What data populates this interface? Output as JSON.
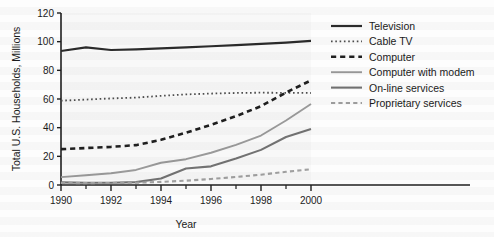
{
  "chart_data": {
    "type": "line",
    "title": "",
    "xlabel": "Year",
    "ylabel": "Total U.S. Households, Millions",
    "xlim": [
      1990,
      2000
    ],
    "ylim": [
      0,
      120
    ],
    "xticks": [
      1990,
      1992,
      1994,
      1996,
      1998,
      2000
    ],
    "xtick_labels": [
      "1990",
      "1992",
      "1994",
      "1996",
      "1998",
      "2000"
    ],
    "xminor_ticks": [
      1991,
      1993,
      1995,
      1997,
      1999
    ],
    "yticks": [
      0,
      20,
      40,
      60,
      80,
      100,
      120
    ],
    "ytick_labels": [
      "0",
      "20",
      "40",
      "60",
      "80",
      "100",
      "120"
    ],
    "grid": false,
    "legend_position": "upper right",
    "x": [
      1990,
      1991,
      1992,
      1993,
      1994,
      1995,
      1996,
      1997,
      1998,
      1999,
      2000
    ],
    "series": [
      {
        "name": "Television",
        "style": "solid",
        "color": "#2b2b2b",
        "width": 2.2,
        "values": [
          93.5,
          96.0,
          94.2,
          94.6,
          95.3,
          96.0,
          96.8,
          97.6,
          98.4,
          99.3,
          100.5
        ]
      },
      {
        "name": "Cable TV",
        "style": "dotted",
        "color": "#4d4d4d",
        "width": 1.8,
        "values": [
          58.8,
          59.6,
          60.4,
          61.0,
          62.2,
          63.2,
          63.8,
          64.2,
          64.4,
          64.3,
          64.2
        ]
      },
      {
        "name": "Computer",
        "style": "dashed",
        "color": "#1f1f1f",
        "width": 2.6,
        "values": [
          25.0,
          25.8,
          26.6,
          27.8,
          31.5,
          36.5,
          42.0,
          48.0,
          55.0,
          64.5,
          73.0
        ]
      },
      {
        "name": "Computer with modem",
        "style": "solid",
        "color": "#9a9a9a",
        "width": 1.9,
        "values": [
          5.5,
          6.8,
          8.2,
          10.5,
          15.5,
          18.0,
          22.5,
          28.0,
          34.5,
          45.0,
          56.5
        ]
      },
      {
        "name": "On-line services",
        "style": "solid",
        "color": "#737373",
        "width": 2.1,
        "values": [
          1.8,
          1.6,
          1.6,
          2.0,
          4.5,
          11.5,
          13.0,
          18.5,
          24.5,
          33.5,
          39.0
        ]
      },
      {
        "name": "Proprietary services",
        "style": "dashed",
        "color": "#a0a0a0",
        "width": 2.1,
        "values": [
          1.4,
          1.3,
          1.4,
          1.6,
          2.2,
          3.0,
          4.2,
          5.6,
          7.2,
          9.2,
          11.0
        ]
      }
    ]
  },
  "legend": {
    "entries": [
      {
        "label": "Television"
      },
      {
        "label": "Cable TV"
      },
      {
        "label": "Computer"
      },
      {
        "label": "Computer with modem"
      },
      {
        "label": "On-line services"
      },
      {
        "label": "Proprietary services"
      }
    ]
  }
}
